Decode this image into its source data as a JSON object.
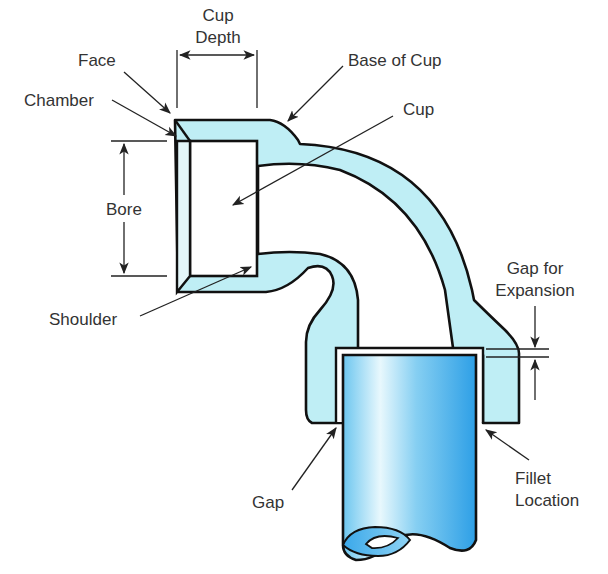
{
  "diagram": {
    "colors": {
      "fitting_fill": "#bfeef5",
      "pipe_light": "#e8f8fd",
      "pipe_dark": "#2d9fe6",
      "outline": "#111111",
      "label_text": "#333333"
    },
    "labels": {
      "cup_depth_line1": "Cup",
      "cup_depth_line2": "Depth",
      "face": "Face",
      "chamber": "Chamber",
      "base_of_cup": "Base of Cup",
      "cup": "Cup",
      "bore": "Bore",
      "shoulder": "Shoulder",
      "gap_expansion_line1": "Gap for",
      "gap_expansion_line2": "Expansion",
      "gap": "Gap",
      "fillet_line1": "Fillet",
      "fillet_line2": "Location"
    },
    "components": [
      "elbow-fitting",
      "inserted-pipe",
      "dimension-lines",
      "leader-arrows"
    ]
  }
}
